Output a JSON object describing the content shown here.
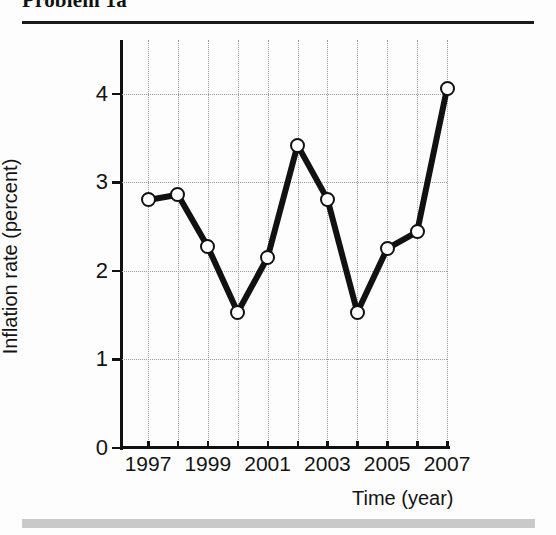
{
  "header": {
    "title": "Problem 1a"
  },
  "chart_data": {
    "type": "line",
    "title": "",
    "xlabel": "Time (year)",
    "ylabel": "Inflation rate (percent)",
    "x": [
      1997,
      1998,
      1999,
      2000,
      2001,
      2002,
      2003,
      2004,
      2005,
      2006,
      2007
    ],
    "values": [
      2.8,
      2.86,
      2.27,
      1.53,
      2.15,
      3.42,
      2.81,
      1.53,
      2.25,
      2.44,
      4.06
    ],
    "series": [
      {
        "name": "Inflation rate",
        "values": [
          2.8,
          2.86,
          2.27,
          1.53,
          2.15,
          3.42,
          2.81,
          1.53,
          2.25,
          2.44,
          4.06
        ]
      }
    ],
    "xlim": [
      1997,
      2007
    ],
    "ylim": [
      0,
      4.35
    ],
    "xticks": [
      1997,
      1998,
      1999,
      2000,
      2001,
      2002,
      2003,
      2004,
      2005,
      2006,
      2007
    ],
    "xticklabels": [
      "1997",
      "",
      "1999",
      "",
      "2001",
      "",
      "2003",
      "",
      "2005",
      "",
      "2007"
    ],
    "yticks": [
      0,
      1,
      2,
      3,
      4
    ],
    "yticklabels": [
      "0",
      "1",
      "2",
      "3",
      "4"
    ],
    "grid": true,
    "grid_style": "dotted",
    "legend": "none",
    "marker": "open-circle",
    "line_color": "#111111",
    "marker_face_color": "#ffffff"
  }
}
